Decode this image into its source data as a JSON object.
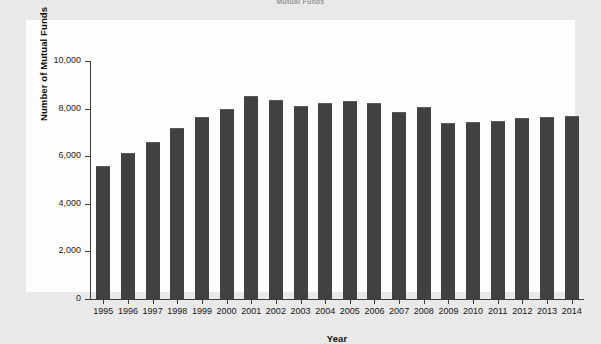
{
  "figure": {
    "title": "Mutual Funds",
    "background_color": "#e9e9e9",
    "panel_color": "#fdfdfd",
    "bar_color": "#414141",
    "axis_color": "#3b3b3b"
  },
  "chart_data": {
    "type": "bar",
    "title": "Mutual Funds",
    "xlabel": "Year",
    "ylabel": "Number of Mutual Funds",
    "categories": [
      "1995",
      "1996",
      "1997",
      "1998",
      "1999",
      "2000",
      "2001",
      "2002",
      "2003",
      "2004",
      "2005",
      "2006",
      "2007",
      "2008",
      "2009",
      "2010",
      "2011",
      "2012",
      "2013",
      "2014"
    ],
    "values": [
      5600,
      6150,
      6600,
      7200,
      7650,
      8000,
      8550,
      8350,
      8100,
      8250,
      8300,
      8250,
      7850,
      8050,
      7400,
      7450,
      7500,
      7600,
      7650,
      7700
    ],
    "ylim": [
      0,
      10000
    ],
    "yticks": [
      0,
      2000,
      4000,
      6000,
      8000,
      10000
    ],
    "ytick_labels": [
      "0",
      "2,000",
      "4,000",
      "6,000",
      "8,000",
      "10,000"
    ],
    "grid": false,
    "legend": null,
    "series": [
      {
        "name": "Number of Mutual Funds",
        "values": [
          5600,
          6150,
          6600,
          7200,
          7650,
          8000,
          8550,
          8350,
          8100,
          8250,
          8300,
          8250,
          7850,
          8050,
          7400,
          7450,
          7500,
          7600,
          7650,
          7700
        ]
      }
    ]
  }
}
